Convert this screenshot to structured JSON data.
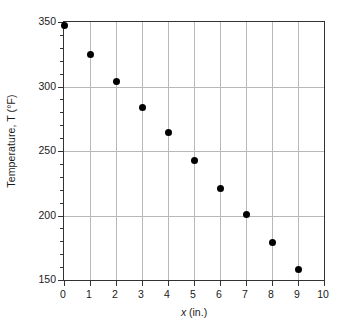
{
  "chart_data": {
    "type": "scatter",
    "title": "",
    "xlabel": "x (in.)",
    "xlabel_italic_part": "x",
    "xlabel_rest": " (in.)",
    "ylabel": "Temperature, T (°F)",
    "ylabel_symbol": "T",
    "ylabel_units": "°F",
    "xlim": [
      0,
      10
    ],
    "ylim": [
      150,
      350
    ],
    "grid": true,
    "grid_color": "#b8b8b8",
    "frame_color": "#333333",
    "marker_color": "#000000",
    "marker_shape": "circle",
    "legend": "none",
    "x_major_ticks": [
      0,
      1,
      2,
      3,
      4,
      5,
      6,
      7,
      8,
      9,
      10
    ],
    "x_tick_labels": [
      "0",
      "1",
      "2",
      "3",
      "4",
      "5",
      "6",
      "7",
      "8",
      "9",
      "10"
    ],
    "y_major_ticks": [
      150,
      200,
      250,
      300,
      350
    ],
    "y_tick_labels": [
      "150",
      "200",
      "250",
      "300",
      "350"
    ],
    "y_minor_tick_interval": 10,
    "x": [
      0,
      1,
      2,
      3,
      4,
      5,
      6,
      7,
      8,
      9
    ],
    "values": [
      347,
      325,
      304,
      284,
      264,
      243,
      221,
      201,
      179,
      158
    ],
    "points": [
      {
        "x": 0,
        "y": 347
      },
      {
        "x": 1,
        "y": 325
      },
      {
        "x": 2,
        "y": 304
      },
      {
        "x": 3,
        "y": 284
      },
      {
        "x": 4,
        "y": 264
      },
      {
        "x": 5,
        "y": 243
      },
      {
        "x": 6,
        "y": 221
      },
      {
        "x": 7,
        "y": 201
      },
      {
        "x": 8,
        "y": 179
      },
      {
        "x": 9,
        "y": 158
      }
    ]
  }
}
